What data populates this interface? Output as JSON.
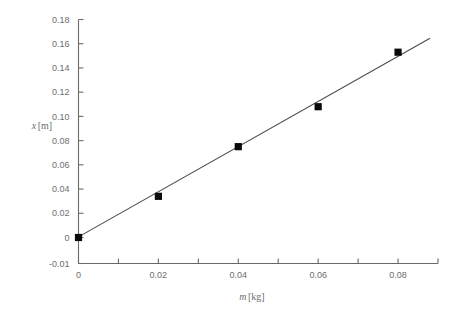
{
  "chart_data": {
    "type": "scatter",
    "title": "",
    "subtitle": "",
    "xlabel": "m [kg]",
    "xlabel_var": "m",
    "xlabel_unit": "[kg]",
    "ylabel": "x [m]",
    "ylabel_var": "x",
    "ylabel_unit": "[m]",
    "x": [
      0,
      0.02,
      0.04,
      0.06,
      0.08
    ],
    "values": [
      0,
      0.034,
      0.075,
      0.108,
      0.153
    ],
    "series": [
      {
        "name": "measured displacement",
        "x": [
          0,
          0.02,
          0.04,
          0.06,
          0.08
        ],
        "values": [
          0,
          0.034,
          0.075,
          0.108,
          0.153
        ],
        "marker": "filled-square",
        "marker_color": "#0a0a0a"
      },
      {
        "name": "linear best fit",
        "type": "line",
        "x": [
          0,
          0.088
        ],
        "values": [
          0.0005,
          0.1645
        ],
        "slope": 1.864,
        "intercept": 0.0005,
        "color": "#4a4a4a"
      }
    ],
    "xlim": [
      0,
      0.09
    ],
    "ylim": [
      -0.01,
      0.18
    ],
    "xticks": [
      0,
      0.01,
      0.02,
      0.03,
      0.04,
      0.05,
      0.06,
      0.07,
      0.08,
      0.09
    ],
    "xtick_labels": [
      "0",
      "",
      "0.02",
      "",
      "0.04",
      "",
      "0.06",
      "",
      "0.08",
      ""
    ],
    "xtick_labels_shown": [
      "0",
      "0.02",
      "0.04",
      "0.06",
      "0.08"
    ],
    "yticks": [
      -0.01,
      0,
      0.02,
      0.04,
      0.06,
      0.08,
      0.1,
      0.12,
      0.14,
      0.16,
      0.18
    ],
    "ytick_labels": [
      "-0.01",
      "0",
      "0.02",
      "0.04",
      "0.06",
      "0.08",
      "0.10",
      "0.12",
      "0.14",
      "0.16",
      "0.18"
    ],
    "grid": false,
    "legend": false,
    "legend_position": "none",
    "axis_color": "#6a6a6a",
    "background": "#ffffff"
  }
}
